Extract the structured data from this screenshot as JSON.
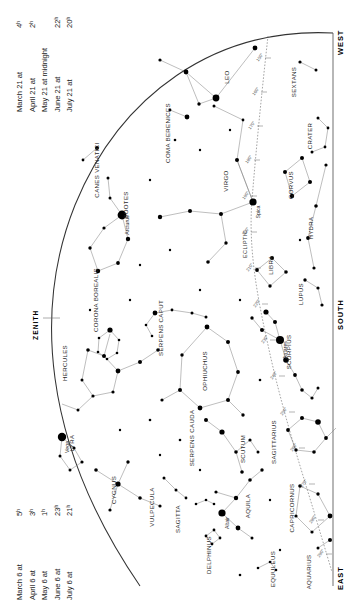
{
  "meta": {
    "width": 350,
    "height": 614
  },
  "date_table_top": {
    "rows": [
      {
        "date": "March 21 at",
        "time": "4ʰ"
      },
      {
        "date": "April 21 at",
        "time": "2ʰ"
      },
      {
        "date": "May 21 at midnight",
        "time": ""
      },
      {
        "date": "June 21 at",
        "time": "22ʰ"
      },
      {
        "date": "July 21 at",
        "time": "20ʰ"
      }
    ]
  },
  "date_table_bottom": {
    "rows": [
      {
        "date": "March 6 at",
        "time": "5ʰ"
      },
      {
        "date": "April 6 at",
        "time": "3ʰ"
      },
      {
        "date": "May 6 at",
        "time": "1ʰ"
      },
      {
        "date": "June 6 at",
        "time": "23ʰ"
      },
      {
        "date": "July 6 at",
        "time": "21ʰ"
      }
    ]
  },
  "cardinals": {
    "west": "WEST",
    "south": "SOUTH",
    "east": "EAST",
    "zenith": "ZENITH"
  },
  "ecliptic": {
    "label": "ECLIPTIC",
    "degree_ticks": [
      "150°",
      "160°",
      "170°",
      "180°",
      "190°",
      "200°",
      "210°",
      "220°",
      "230°",
      "240°",
      "250°",
      "260°",
      "270°",
      "280°",
      "290°",
      "300°",
      "310°"
    ]
  },
  "named_stars": [
    {
      "name": "Arcturus",
      "x": 122,
      "y": 215,
      "mag": 0.0
    },
    {
      "name": "Spica",
      "x": 253,
      "y": 202,
      "mag": 1.0
    },
    {
      "name": "Antares",
      "x": 280,
      "y": 340,
      "mag": 1.0
    },
    {
      "name": "Vega",
      "x": 62,
      "y": 437,
      "mag": 0.0
    },
    {
      "name": "Altair",
      "x": 222,
      "y": 513,
      "mag": 0.8
    }
  ],
  "constellations": [
    {
      "name": "LEO",
      "x": 229,
      "y": 77,
      "rot": -90
    },
    {
      "name": "SEXTANS",
      "x": 296,
      "y": 82,
      "rot": -90
    },
    {
      "name": "COMA BERENICES",
      "x": 170,
      "y": 133,
      "rot": -90
    },
    {
      "name": "CANES VENATICI",
      "x": 99,
      "y": 170,
      "rot": -90
    },
    {
      "name": "CRATER",
      "x": 312,
      "y": 136,
      "rot": -90
    },
    {
      "name": "VIRGO",
      "x": 228,
      "y": 181,
      "rot": -90
    },
    {
      "name": "CORVUS",
      "x": 293,
      "y": 185,
      "rot": -90
    },
    {
      "name": "BOOTES",
      "x": 128,
      "y": 205,
      "rot": -90
    },
    {
      "name": "HYDRA",
      "x": 313,
      "y": 228,
      "rot": -90
    },
    {
      "name": "LIBRA",
      "x": 273,
      "y": 265,
      "rot": -90
    },
    {
      "name": "CORONA BOREALIS",
      "x": 98,
      "y": 300,
      "rot": -90
    },
    {
      "name": "LUPUS",
      "x": 303,
      "y": 294,
      "rot": -90
    },
    {
      "name": "SERPENS CAPUT",
      "x": 163,
      "y": 328,
      "rot": -90
    },
    {
      "name": "SCORPIUS",
      "x": 291,
      "y": 352,
      "rot": -90
    },
    {
      "name": "HERCULES",
      "x": 67,
      "y": 363,
      "rot": -90
    },
    {
      "name": "OPHIUCHUS",
      "x": 207,
      "y": 371,
      "rot": -90
    },
    {
      "name": "SERPENS CAUDA",
      "x": 194,
      "y": 438,
      "rot": -90
    },
    {
      "name": "SAGITTARIUS",
      "x": 276,
      "y": 442,
      "rot": -90
    },
    {
      "name": "LYRA",
      "x": 74,
      "y": 443,
      "rot": -90
    },
    {
      "name": "SCUTUM",
      "x": 245,
      "y": 449,
      "rot": -90
    },
    {
      "name": "CYGNUS",
      "x": 116,
      "y": 490,
      "rot": -90
    },
    {
      "name": "VULPECULA",
      "x": 154,
      "y": 507,
      "rot": -90
    },
    {
      "name": "AQUILA",
      "x": 250,
      "y": 506,
      "rot": -90
    },
    {
      "name": "SAGITTA",
      "x": 180,
      "y": 519,
      "rot": -90
    },
    {
      "name": "CAPRICORNUS",
      "x": 294,
      "y": 508,
      "rot": -90
    },
    {
      "name": "DELPHINUS",
      "x": 211,
      "y": 555,
      "rot": -90
    },
    {
      "name": "EQUULEUS",
      "x": 275,
      "y": 569,
      "rot": -90
    },
    {
      "name": "AQUARIUS",
      "x": 311,
      "y": 572,
      "rot": -90
    }
  ],
  "colors": {
    "background": "#ffffff",
    "star": "#000000",
    "line": "#777777",
    "horizon": "#333333",
    "text": "#1a1a1a"
  }
}
